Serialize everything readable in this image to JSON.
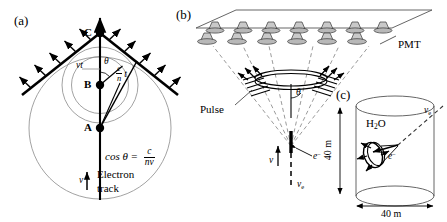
{
  "figure": {
    "background": "#ffffff",
    "ink": "#000000",
    "thin_line": "#7a7a7a",
    "dash_line": "#8c8c8c",
    "pmt_fill": "#d0d0d0"
  },
  "panel_a": {
    "letter": "(a)",
    "point_a": "A",
    "point_b": "B",
    "point_c": "C",
    "label_vt": "vt",
    "label_theta": "θ",
    "label_ct_num": "c",
    "label_ct_den": "n",
    "label_ct_t": "t",
    "equation_lhs": "cos θ =",
    "equation_num": "c",
    "equation_den": "nv",
    "velocity_symbol": "v",
    "track_line1": "Electron",
    "track_line2": "track"
  },
  "panel_b": {
    "letter": "(b)",
    "pmt_label": "PMT",
    "pulse_label": "Pulse",
    "theta_label": "θ",
    "velocity_symbol": "v",
    "electron_label": "e",
    "electron_charge": "−",
    "neutrino_label": "ν",
    "neutrino_sub": "e",
    "pmt_count_back": 7,
    "pmt_count_front": 6
  },
  "panel_c": {
    "letter": "(c)",
    "water_label": "H",
    "water_sub": "2",
    "water_label_end": "O",
    "height_label": "40 m",
    "width_label": "40 m",
    "neutrino_label": "ν",
    "neutrino_sub": "e",
    "electron_label": "e",
    "electron_charge": "−"
  }
}
